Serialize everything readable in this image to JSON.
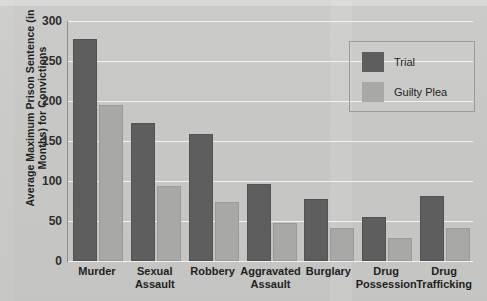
{
  "chart_data": {
    "type": "bar",
    "title": "",
    "subtitle": "",
    "xlabel": "",
    "ylabel": "Average Maximum Prison Sentence (in Months) for Convictions",
    "ylim": [
      0,
      300
    ],
    "ytick_labels": [
      "300",
      "250",
      "200",
      "150",
      "100",
      "50",
      "0"
    ],
    "yticks": [
      300,
      250,
      200,
      150,
      100,
      50,
      0
    ],
    "grid": true,
    "grid_axis": "y",
    "legend_position": "top-right",
    "categories": [
      "Murder",
      "Sexual Assault",
      "Robbery",
      "Aggravated Assault",
      "Burglary",
      "Drug Possession",
      "Drug Trafficking"
    ],
    "category_lines": [
      [
        "Murder"
      ],
      [
        "Sexual",
        "Assault"
      ],
      [
        "Robbery"
      ],
      [
        "Aggravated",
        "Assault"
      ],
      [
        "Burglary"
      ],
      [
        "Drug",
        "Possession"
      ],
      [
        "Drug",
        "Trafficking"
      ]
    ],
    "series": [
      {
        "name": "Trial",
        "color": "#5e5e5e",
        "values": [
          277,
          172,
          159,
          96,
          78,
          55,
          81
        ]
      },
      {
        "name": "Guilty Plea",
        "color": "#a8a8a6",
        "values": [
          195,
          94,
          74,
          48,
          41,
          29,
          41
        ]
      }
    ]
  },
  "colors": {
    "background": "#c9c9c7",
    "gridline": "#f2f2f0",
    "axis": "#8f8f8d",
    "text": "#1f1f1f",
    "trial": "#5e5e5e",
    "guilty_plea": "#a8a8a6",
    "legend_border": "#9a9a98"
  }
}
